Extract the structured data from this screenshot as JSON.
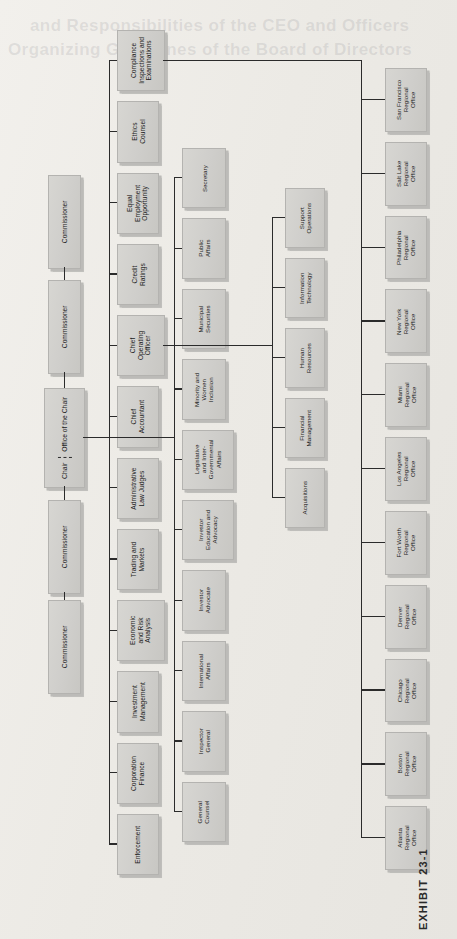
{
  "exhibit": {
    "label": "EXHIBIT 23-1"
  },
  "page_bleed": [
    {
      "text": "Organizing Guidelines of the Board of Directors",
      "x": 8,
      "y": 40
    },
    {
      "text": "and Responsibilities of the CEO and Officers",
      "x": 30,
      "y": 16
    }
  ],
  "chart_data": {
    "type": "diagram",
    "orientation": "rotated-90",
    "root": {
      "name": "Chair",
      "subtitle": "Office of the Chair"
    },
    "commissioners": [
      {
        "label": "Commissioner"
      },
      {
        "label": "Commissioner"
      },
      {
        "label": "Commissioner"
      },
      {
        "label": "Commissioner"
      }
    ],
    "divisions_column_1": [
      {
        "label": "Compliance\nInspections and\nExaminations"
      },
      {
        "label": "Ethics\nCounsel"
      },
      {
        "label": "Equal\nEmployment\nOpportunity"
      },
      {
        "label": "Credit\nRatings"
      },
      {
        "label": "Chief\nOperating\nOfficer"
      },
      {
        "label": "Chief\nAccountant"
      },
      {
        "label": "Administrative\nLaw Judges"
      },
      {
        "label": "Trading and\nMarkets"
      },
      {
        "label": "Economic\nand Risk\nAnalysis"
      },
      {
        "label": "Investment\nManagement"
      },
      {
        "label": "Corporation\nFinance"
      },
      {
        "label": "Enforcement"
      }
    ],
    "divisions_column_2": [
      {
        "label": "Secretary"
      },
      {
        "label": "Public\nAffairs"
      },
      {
        "label": "Municipal\nSecurities"
      },
      {
        "label": "Minority and\nWomen\nInclusion"
      },
      {
        "label": "Legislative\nand Inter-\nGovernmental\nAffairs"
      },
      {
        "label": "Investor\nEducation and\nAdvocacy"
      },
      {
        "label": "Investor\nAdvocate"
      },
      {
        "label": "International\nAffairs"
      },
      {
        "label": "Inspector\nGeneral"
      },
      {
        "label": "General\nCounsel"
      }
    ],
    "operating_units_column_3": [
      {
        "label": "Support\nOperations"
      },
      {
        "label": "Information\nTechnology"
      },
      {
        "label": "Human\nResources"
      },
      {
        "label": "Financial\nManagement"
      },
      {
        "label": "Acquisitions"
      }
    ],
    "regional_offices": [
      {
        "label": "San Francisco\nRegional\nOffice"
      },
      {
        "label": "Salt Lake\nRegional\nOffice"
      },
      {
        "label": "Philadelphia\nRegional\nOffice"
      },
      {
        "label": "New York\nRegional\nOffice"
      },
      {
        "label": "Miami\nRegional\nOffice"
      },
      {
        "label": "Los Angeles\nRegional\nOffice"
      },
      {
        "label": "Fort Worth\nRegional\nOffice"
      },
      {
        "label": "Denver\nRegional\nOffice"
      },
      {
        "label": "Chicago\nRegional\nOffice"
      },
      {
        "label": "Boston\nRegional\nOffice"
      },
      {
        "label": "Atlanta\nRegional\nOffice"
      }
    ],
    "colors": {
      "box_fill": "#d2d1cd",
      "box_border": "#b4b3b0",
      "line": "#2b2b2b",
      "page": "#eceae6",
      "text": "#1c1c1c"
    }
  },
  "layout": {
    "commissioner": {
      "x": 48,
      "w": 31,
      "ys": [
        175,
        280,
        500,
        600
      ],
      "h": 92
    },
    "chair": {
      "x": 44,
      "y": 388,
      "w": 39,
      "h": 98
    },
    "col1": {
      "x": 117,
      "w": 40
    },
    "col2": {
      "x": 182,
      "w": 42
    },
    "col3": {
      "x": 285,
      "w": 38
    },
    "regional": {
      "x": 385,
      "w": 40
    },
    "trunk1_x": 109,
    "trunk2_x": 174,
    "trunk3_x": 272,
    "trunk4_x": 361
  }
}
